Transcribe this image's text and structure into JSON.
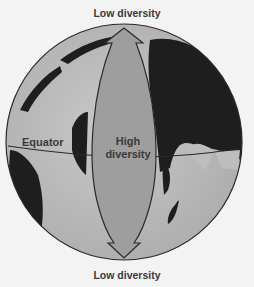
{
  "labels": {
    "top": "Low diversity",
    "bottom": "Low diversity",
    "equator": "Equator",
    "center_line1": "High",
    "center_line2": "diversity"
  },
  "colors": {
    "background": "#f3f3f3",
    "ocean": "#bdbdbd",
    "land": "#1e1e1e",
    "arrow_fill": "#9e9e9e",
    "outline": "#2a2a2a",
    "text": "#3a3a3a"
  },
  "icons": {
    "globe": "globe-icon",
    "arrow": "double-headed-arrow-icon"
  }
}
